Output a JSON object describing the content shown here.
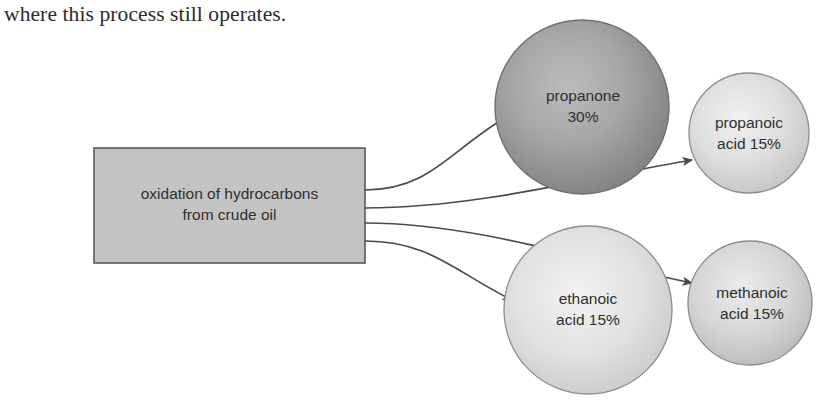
{
  "caption": {
    "text": "where this process still operates."
  },
  "diagram": {
    "type": "flow-diagram",
    "source": {
      "id": "source-box",
      "shape": "rectangle",
      "line1": "oxidation of hydrocarbons",
      "line2": "from crude oil",
      "fill": "#c3c3c3",
      "stroke": "#5a5a5a",
      "x": 94,
      "y": 148,
      "width": 271,
      "height": 115
    },
    "products": [
      {
        "id": "propanone",
        "name": "propanone",
        "percent": "30%",
        "line1": "propanone",
        "line2": "30%",
        "shape": "circle",
        "cx": 582,
        "cy": 107,
        "r": 87,
        "fill_center": "#b4b4b4",
        "fill_edge": "#7d7d7d",
        "stroke": "#6f6f6f"
      },
      {
        "id": "propanoic-acid",
        "name": "propanoic acid",
        "percent": "15%",
        "line1": "propanoic",
        "line2": "acid 15%",
        "shape": "circle",
        "cx": 749,
        "cy": 133,
        "r": 60,
        "fill_center": "#ececec",
        "fill_edge": "#c4c4c4",
        "stroke": "#8d8d8d"
      },
      {
        "id": "ethanoic-acid",
        "name": "ethanoic acid",
        "percent": "15%",
        "line1": "ethanoic",
        "line2": "acid 15%",
        "shape": "circle",
        "cx": 588,
        "cy": 310,
        "r": 84,
        "fill_center": "#ededed",
        "fill_edge": "#c7c7c7",
        "stroke": "#8d8d8d"
      },
      {
        "id": "methanoic-acid",
        "name": "methanoic acid",
        "percent": "15%",
        "line1": "methanoic",
        "line2": "acid 15%",
        "shape": "circle",
        "cx": 750,
        "cy": 303,
        "r": 62,
        "fill_center": "#e4e4e4",
        "fill_edge": "#b9b9b9",
        "stroke": "#8a8a8a"
      }
    ],
    "arrows": [
      {
        "id": "arrow-to-propanone",
        "from": "source-box",
        "to": "propanone",
        "exit_y": 190
      },
      {
        "id": "arrow-to-propanoic-acid",
        "from": "source-box",
        "to": "propanoic-acid",
        "exit_y": 208
      },
      {
        "id": "arrow-to-methanoic-acid",
        "from": "source-box",
        "to": "methanoic-acid",
        "exit_y": 223
      },
      {
        "id": "arrow-to-ethanoic-acid",
        "from": "source-box",
        "to": "ethanoic-acid",
        "exit_y": 241
      }
    ],
    "colors": {
      "line": "#4a4a4a",
      "text": "#2f2f2f",
      "background": "#ffffff"
    }
  }
}
